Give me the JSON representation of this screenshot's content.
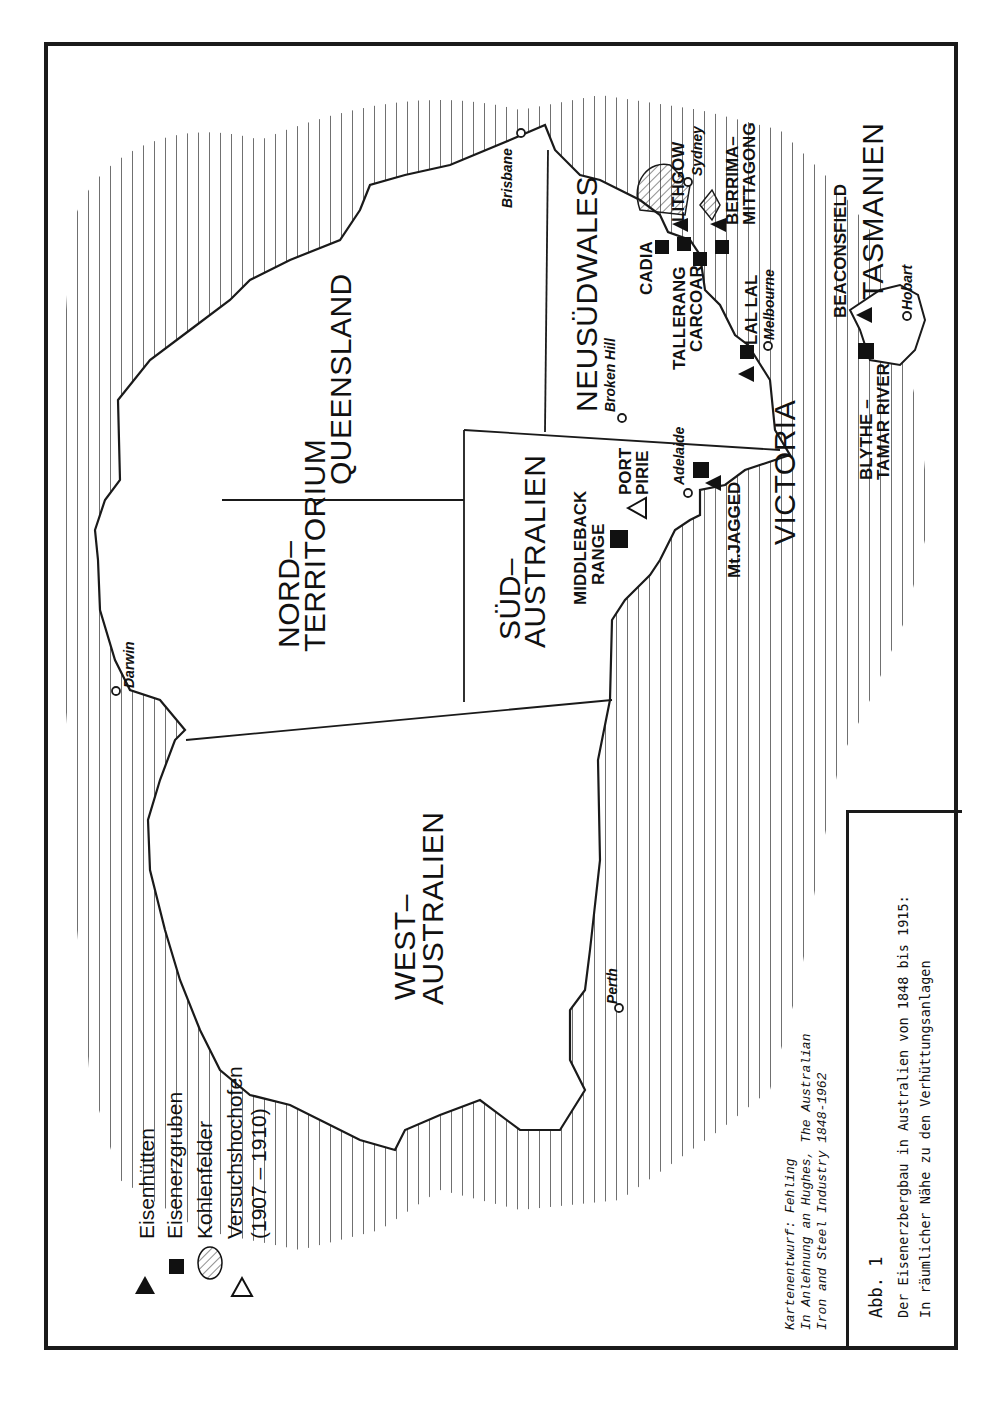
{
  "figure": {
    "label": "Abb. 1",
    "title_line1": "Der Eisenerzbergbau in Australien von 1848 bis 1915:",
    "title_line2": "In räumlicher Nähe zu den Verhüttungsanlagen",
    "orientation": "rotated 90° counter-clockwise"
  },
  "source": {
    "line1": "Kartenentwurf: Fehling",
    "line2": "In Anlehnung an Hughes,  The Australian",
    "line3": "Iron and Steel Industry 1848-1962"
  },
  "legend": {
    "items": [
      {
        "symbol": "filled-triangle",
        "label": "Eisenhütten"
      },
      {
        "symbol": "filled-square",
        "label": "Eisenerzgruben"
      },
      {
        "symbol": "hatched-ellipse",
        "label": "Kohlenfelder"
      },
      {
        "symbol": "open-triangle",
        "label": "Versuchshochofen",
        "sublabel": "(1907 – 1910)"
      }
    ]
  },
  "regions": {
    "west": {
      "line1": "WEST–",
      "line2": "AUSTRALIEN"
    },
    "nord": {
      "line1": "NORD–",
      "line2": "TERRITORIUM"
    },
    "queensland": {
      "line1": "QUEENSLAND"
    },
    "sued": {
      "line1": "SÜD–",
      "line2": "AUSTRALIEN"
    },
    "nsw": {
      "line1": "NEUSÜDWALES"
    },
    "victoria": {
      "line1": "VICTORIA"
    },
    "tasmanien": {
      "line1": "TASMANIEN"
    }
  },
  "cities": {
    "darwin": "Darwin",
    "brisbane": "Brisbane",
    "perth": "Perth",
    "adelaide": "Adelaide",
    "broken_hill": "Broken Hill",
    "melbourne": "Melbourne",
    "sydney": "Sydney",
    "hobart": "Hobart"
  },
  "sites": {
    "middleback": {
      "line1": "MIDDLEBACK",
      "line2": "RANGE",
      "type": "Eisenerzgruben"
    },
    "port_pirie": {
      "line1": "PORT",
      "line2": "PIRIE",
      "type": "Versuchshochofen"
    },
    "mt_jagged": {
      "line1": "Mt.JAGGED",
      "type": "Eisenerzgruben / Eisenhütten"
    },
    "lal_lal": {
      "line1": "LAL LAL",
      "type": "Eisenhütten / Eisenerzgruben"
    },
    "cadia": {
      "line1": "CADIA",
      "type": "Eisenerzgruben"
    },
    "tallerang": {
      "line1": "TALLERANG",
      "type": "Eisenerzgruben"
    },
    "carcoar": {
      "line1": "CARCOAR",
      "type": "Eisenerzgruben"
    },
    "lithgow": {
      "line1": "LITHGOW",
      "type": "Eisenhütten"
    },
    "berrima": {
      "line1": "BERRIMA–",
      "line2": "MITTAGONG",
      "type": "Eisenhütten / Eisenerzgruben"
    },
    "beaconsfield": {
      "line1": "BEACONSFIELD",
      "type": "Eisenhütten"
    },
    "blythe": {
      "line1": "BLYTHE –",
      "line2": "TAMAR RIVER",
      "type": "Eisenerzgruben"
    }
  },
  "colors": {
    "ink": "#1a1a1a",
    "paper": "#ffffff"
  }
}
